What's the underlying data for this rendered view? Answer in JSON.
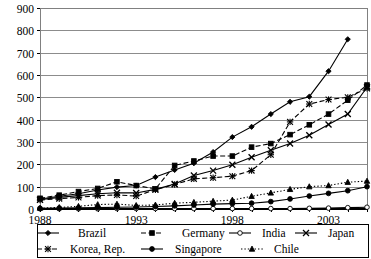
{
  "chart_data": {
    "type": "line",
    "title": "",
    "subtitle": "",
    "xlabel": "",
    "ylabel": "",
    "xlim": [
      1988,
      2005
    ],
    "ylim": [
      0,
      900
    ],
    "ytick_step": 100,
    "yticks": [
      0,
      100,
      200,
      300,
      400,
      500,
      600,
      700,
      800,
      900
    ],
    "ytick_labels": [
      "0",
      "100",
      "200",
      "300",
      "400",
      "500",
      "600",
      "700",
      "800",
      "900"
    ],
    "x": [
      1988,
      1989,
      1990,
      1991,
      1992,
      1993,
      1994,
      1995,
      1996,
      1997,
      1998,
      1999,
      2000,
      2001,
      2002,
      2003,
      2004,
      2005
    ],
    "xtick_labels_shown": [
      "1988",
      "1993",
      "1998",
      "2003"
    ],
    "xtick_label_years": [
      1988,
      1993,
      1998,
      2003
    ],
    "grid": "horizontal",
    "legend_position": "bottom",
    "series": [
      {
        "name": "Brazil",
        "marker": "diamond",
        "line_style": "solid",
        "values": [
          45,
          57,
          68,
          85,
          98,
          105,
          143,
          175,
          205,
          255,
          322,
          368,
          425,
          480,
          503,
          617,
          760,
          null
        ]
      },
      {
        "name": "Germany",
        "marker": "square",
        "line_style": "dashed",
        "values": [
          48,
          62,
          78,
          92,
          122,
          105,
          90,
          195,
          215,
          237,
          237,
          277,
          293,
          333,
          377,
          425,
          487,
          555
        ]
      },
      {
        "name": "India",
        "marker": "circle-open",
        "line_style": "solid",
        "values": [
          1,
          1,
          1,
          1,
          2,
          2,
          2,
          2,
          2,
          2,
          2,
          2,
          2,
          2,
          3,
          4,
          6,
          8
        ]
      },
      {
        "name": "Japan",
        "marker": "cross",
        "line_style": "solid",
        "values": [
          42,
          52,
          60,
          68,
          73,
          72,
          88,
          112,
          150,
          172,
          198,
          232,
          263,
          293,
          330,
          378,
          425,
          545
        ]
      },
      {
        "name": "Korea, Rep.",
        "marker": "asterisk",
        "line_style": "dashed",
        "values": [
          40,
          46,
          52,
          60,
          63,
          58,
          86,
          110,
          135,
          140,
          147,
          172,
          243,
          390,
          470,
          490,
          500,
          540
        ]
      },
      {
        "name": "Singapore",
        "marker": "circle-filled",
        "line_style": "solid",
        "values": [
          3,
          4,
          5,
          6,
          8,
          9,
          11,
          14,
          18,
          22,
          24,
          26,
          33,
          45,
          58,
          70,
          82,
          100
        ]
      },
      {
        "name": "Chile",
        "marker": "triangle",
        "line_style": "dotted",
        "values": [
          4,
          7,
          12,
          20,
          22,
          16,
          18,
          26,
          30,
          35,
          40,
          57,
          72,
          88,
          100,
          105,
          120,
          125
        ]
      }
    ]
  },
  "legend": {
    "items": [
      {
        "label": "Brazil"
      },
      {
        "label": "Germany"
      },
      {
        "label": "India"
      },
      {
        "label": "Japan"
      },
      {
        "label": "Korea, Rep."
      },
      {
        "label": "Singapore"
      },
      {
        "label": "Chile"
      }
    ]
  }
}
